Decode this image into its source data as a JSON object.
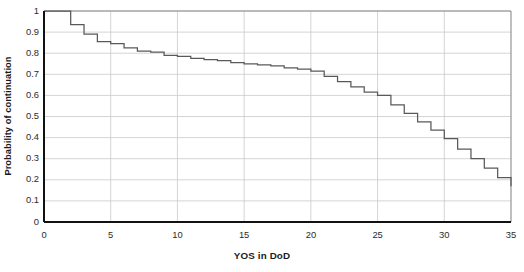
{
  "chart_data": {
    "type": "line",
    "subtype": "step",
    "title": "",
    "xlabel": "YOS in DoD",
    "ylabel": "Probability of continuation",
    "xlim": [
      0,
      35
    ],
    "ylim": [
      0,
      1
    ],
    "xticks": [
      0,
      5,
      10,
      15,
      20,
      25,
      30,
      35
    ],
    "xtick_labels": [
      "0",
      "5",
      "10",
      "15",
      "20",
      "25",
      "30",
      "35"
    ],
    "yticks": [
      0,
      0.1,
      0.2,
      0.3,
      0.4,
      0.5,
      0.6,
      0.7,
      0.8,
      0.9,
      1
    ],
    "ytick_labels": [
      "0",
      "0.1",
      "0.2",
      "0.3",
      "0.4",
      "0.5",
      "0.6",
      "0.7",
      "0.8",
      "0.9",
      "1"
    ],
    "grid": "horizontal-and-vertical",
    "grid_color": "#c9c9c9",
    "legend": "none",
    "line_color": "#595959",
    "series": [
      {
        "name": "Probability of continuation",
        "step": "post",
        "x": [
          0,
          1,
          2,
          3,
          4,
          5,
          6,
          7,
          8,
          9,
          10,
          11,
          12,
          13,
          14,
          15,
          16,
          17,
          18,
          19,
          20,
          21,
          22,
          23,
          24,
          25,
          26,
          27,
          28,
          29,
          30,
          31,
          32,
          33,
          34,
          35
        ],
        "values": [
          1.0,
          1.0,
          0.935,
          0.89,
          0.855,
          0.845,
          0.825,
          0.81,
          0.805,
          0.79,
          0.785,
          0.775,
          0.77,
          0.765,
          0.755,
          0.75,
          0.745,
          0.74,
          0.73,
          0.725,
          0.715,
          0.69,
          0.665,
          0.64,
          0.615,
          0.6,
          0.555,
          0.515,
          0.475,
          0.435,
          0.395,
          0.345,
          0.3,
          0.255,
          0.21,
          0.17
        ]
      }
    ]
  },
  "axes": {
    "plot_area": {
      "left": 44,
      "top": 11,
      "right": 511,
      "bottom": 222
    }
  }
}
